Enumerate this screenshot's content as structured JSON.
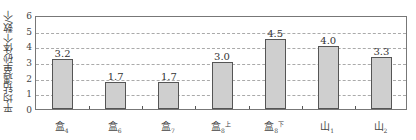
{
  "chart_data": {
    "type": "bar",
    "title": "",
    "xlabel": "",
    "ylabel": "平均钻遇单砂体个数/个",
    "ylim": [
      0,
      6
    ],
    "yticks": [
      0,
      1,
      2,
      3,
      4,
      5,
      6
    ],
    "grid": "horizontal-dashed",
    "categories": [
      "盒4",
      "盒6",
      "盒7",
      "盒8上",
      "盒8下",
      "山1",
      "山2"
    ],
    "category_display": [
      {
        "base": "盒",
        "sub": "4",
        "sup": ""
      },
      {
        "base": "盒",
        "sub": "6",
        "sup": ""
      },
      {
        "base": "盒",
        "sub": "7",
        "sup": ""
      },
      {
        "base": "盒",
        "sub": "8",
        "sup": "上"
      },
      {
        "base": "盒",
        "sub": "8",
        "sup": "下"
      },
      {
        "base": "山",
        "sub": "1",
        "sup": ""
      },
      {
        "base": "山",
        "sub": "2",
        "sup": ""
      }
    ],
    "values": [
      3.2,
      1.7,
      1.7,
      3.0,
      4.5,
      4.0,
      3.3
    ],
    "value_labels": [
      "3.2",
      "1.7",
      "1.7",
      "3.0",
      "4.5",
      "4.0",
      "3.3"
    ],
    "bar_color": "#cfcfcf",
    "bar_edge_color": "#555555",
    "legend": null
  }
}
